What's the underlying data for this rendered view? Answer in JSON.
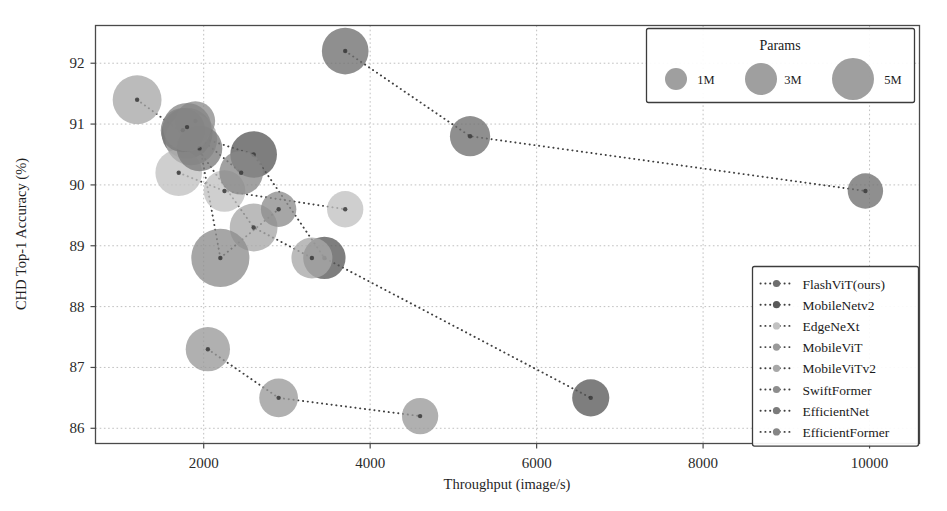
{
  "chart_data": {
    "type": "scatter",
    "title": "",
    "xlabel": "Throughput (image/s)",
    "ylabel": "CHD Top-1 Accuracy (%)",
    "xlim": [
      700,
      10600
    ],
    "ylim": [
      85.75,
      92.62
    ],
    "xticks": [
      2000,
      4000,
      6000,
      8000,
      10000
    ],
    "xtick_labels": [
      "2000",
      "4000",
      "6000",
      "8000",
      "10000"
    ],
    "yticks": [
      86,
      87,
      88,
      89,
      90,
      91,
      92
    ],
    "ytick_labels": [
      "86",
      "87",
      "88",
      "89",
      "90",
      "91",
      "92"
    ],
    "grid": true,
    "legend_position": "lower right",
    "size_legend": {
      "title": "Params",
      "entries": [
        {
          "label": "1M",
          "params": 1,
          "radius_px": 11
        },
        {
          "label": "3M",
          "params": 3,
          "radius_px": 16
        },
        {
          "label": "5M",
          "params": 5,
          "radius_px": 21
        }
      ]
    },
    "series": [
      {
        "name": "FlashViT(ours)",
        "color": "#6f6f6f",
        "points": [
          {
            "x": 3700,
            "y": 92.2,
            "params": 2.6
          },
          {
            "x": 5200,
            "y": 90.8,
            "params": 1.6
          },
          {
            "x": 9950,
            "y": 89.9,
            "params": 1.0
          }
        ]
      },
      {
        "name": "MobileNetv2",
        "color": "#5a5a5a",
        "points": [
          {
            "x": 1800,
            "y": 90.85,
            "params": 3.4
          },
          {
            "x": 2600,
            "y": 90.5,
            "params": 2.6
          },
          {
            "x": 3450,
            "y": 88.8,
            "params": 1.9
          },
          {
            "x": 6650,
            "y": 86.5,
            "params": 1.2
          }
        ]
      },
      {
        "name": "EdgeNeXt",
        "color": "#c2c2c2",
        "points": [
          {
            "x": 1700,
            "y": 90.2,
            "params": 2.6
          },
          {
            "x": 2250,
            "y": 89.9,
            "params": 1.8
          },
          {
            "x": 3700,
            "y": 89.6,
            "params": 1.1
          }
        ]
      },
      {
        "name": "MobileViT",
        "color": "#9a9a9a",
        "points": [
          {
            "x": 2050,
            "y": 87.3,
            "params": 2.2
          },
          {
            "x": 2900,
            "y": 86.5,
            "params": 1.4
          },
          {
            "x": 4600,
            "y": 86.2,
            "params": 1.1
          }
        ]
      },
      {
        "name": "MobileViTv2",
        "color": "#a8a8a8",
        "points": [
          {
            "x": 1200,
            "y": 91.4,
            "params": 3.0
          },
          {
            "x": 1850,
            "y": 90.75,
            "params": 3.6
          },
          {
            "x": 2600,
            "y": 89.3,
            "params": 2.8
          },
          {
            "x": 3300,
            "y": 88.8,
            "params": 1.7
          }
        ]
      },
      {
        "name": "SwiftFormer",
        "color": "#8d8d8d",
        "points": [
          {
            "x": 1900,
            "y": 91.05,
            "params": 1.5
          },
          {
            "x": 2200,
            "y": 88.8,
            "params": 5.0
          },
          {
            "x": 2900,
            "y": 89.6,
            "params": 1.0
          }
        ]
      },
      {
        "name": "EfficientNet",
        "color": "#7b7b7b",
        "points": [
          {
            "x": 1750,
            "y": 90.9,
            "params": 2.2
          },
          {
            "x": 1950,
            "y": 90.6,
            "params": 2.4
          }
        ]
      },
      {
        "name": "EfficientFormer",
        "color": "#868686",
        "points": [
          {
            "x": 1800,
            "y": 90.95,
            "params": 2.9
          },
          {
            "x": 2450,
            "y": 90.2,
            "params": 2.1
          }
        ]
      }
    ]
  },
  "axes": {
    "x_title": "Throughput (image/s)",
    "y_title": "CHD Top-1 Accuracy (%)"
  },
  "legend": {
    "entries": [
      {
        "label": "FlashViT(ours)"
      },
      {
        "label": "MobileNetv2"
      },
      {
        "label": "EdgeNeXt"
      },
      {
        "label": "MobileViT"
      },
      {
        "label": "MobileViTv2"
      },
      {
        "label": "SwiftFormer"
      },
      {
        "label": "EfficientNet"
      },
      {
        "label": "EfficientFormer"
      }
    ]
  },
  "size_legend": {
    "title": "Params",
    "labels": [
      "1M",
      "3M",
      "5M"
    ]
  }
}
